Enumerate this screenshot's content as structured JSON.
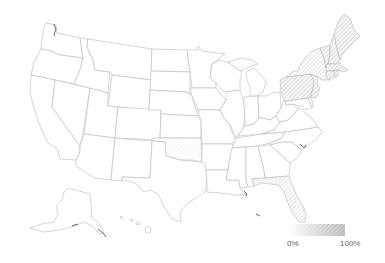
{
  "map": {
    "type": "choropleth",
    "region": "United States",
    "fill_pattern": "diagonal-hatch",
    "colors": {
      "empty": "#ffffff",
      "low": "#f4f4f4",
      "high": "#b0b0b0",
      "border": "#b9b9b9"
    },
    "shaded_states": [
      {
        "state": "Maine",
        "level": 0.45
      },
      {
        "state": "New Hampshire",
        "level": 0.35
      },
      {
        "state": "Vermont",
        "level": 0.35
      },
      {
        "state": "Massachusetts",
        "level": 0.4
      },
      {
        "state": "Connecticut",
        "level": 0.4
      },
      {
        "state": "Rhode Island",
        "level": 0.4
      },
      {
        "state": "New York",
        "level": 0.3
      },
      {
        "state": "Pennsylvania",
        "level": 0.35
      },
      {
        "state": "New Jersey",
        "level": 0.4
      },
      {
        "state": "Oklahoma",
        "level": 0.15
      },
      {
        "state": "Florida",
        "level": 0.3
      }
    ]
  },
  "legend": {
    "min_label": "0%",
    "max_label": "100%"
  }
}
